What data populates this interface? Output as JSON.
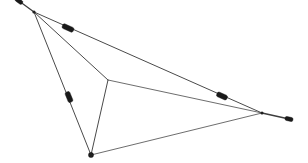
{
  "figure": {
    "canvas": {
      "width": 308,
      "height": 163,
      "background": "#ffffff"
    },
    "colors": {
      "line": "#4a4a4a",
      "line_light": "#5c5c5c",
      "tail": "#3d3d3d",
      "marker": "#1a1a1a",
      "vertex": "#1f1f1f"
    },
    "vertices": [
      {
        "name": "top-vertex",
        "x": 34,
        "y": 12,
        "kind": "hub"
      },
      {
        "name": "central-junction",
        "x": 108,
        "y": 80,
        "kind": "junction"
      },
      {
        "name": "bottom-vertex",
        "x": 91,
        "y": 155,
        "kind": "node"
      },
      {
        "name": "right-vertex",
        "x": 262,
        "y": 113,
        "kind": "hub"
      }
    ],
    "edges": [
      {
        "name": "edge-top-to-right",
        "from": "top-vertex",
        "to": "right-vertex",
        "d": "M 34 12 L 262 113"
      },
      {
        "name": "edge-top-to-junction",
        "from": "top-vertex",
        "to": "central-junction",
        "d": "M 34 12 L 108 80"
      },
      {
        "name": "edge-top-to-bottom",
        "from": "top-vertex",
        "to": "bottom-vertex",
        "d": "M 34 12 L 91 155"
      },
      {
        "name": "edge-junction-to-right",
        "from": "central-junction",
        "to": "right-vertex",
        "d": "M 108 80 L 262 113"
      },
      {
        "name": "edge-junction-to-bottom",
        "from": "central-junction",
        "to": "bottom-vertex",
        "d": "M 108 80 L 91 155"
      },
      {
        "name": "edge-bottom-to-right",
        "from": "bottom-vertex",
        "to": "right-vertex",
        "d": "M 91 155 L 262 113"
      }
    ],
    "tails": [
      {
        "name": "tail-top-left",
        "d": "M 34 12 L 19 1"
      },
      {
        "name": "tail-far-right",
        "d": "M 262 113 L 289 119"
      }
    ],
    "markers": [
      {
        "name": "marker-top-left-end",
        "x": 19,
        "y": 1,
        "w": 8,
        "h": 4,
        "angle": 36
      },
      {
        "name": "marker-top-edge",
        "x": 68,
        "y": 28,
        "w": 12,
        "h": 5,
        "angle": 24
      },
      {
        "name": "marker-left-edge",
        "x": 69,
        "y": 97,
        "w": 11,
        "h": 5,
        "angle": 68
      },
      {
        "name": "marker-right-edge",
        "x": 222,
        "y": 96,
        "w": 11,
        "h": 5,
        "angle": 24
      },
      {
        "name": "marker-far-right-end",
        "x": 289,
        "y": 119,
        "w": 8,
        "h": 4,
        "angle": 12
      },
      {
        "name": "marker-bottom-vertex",
        "x": 91,
        "y": 155,
        "w": 5,
        "h": 5,
        "angle": 0
      }
    ]
  }
}
